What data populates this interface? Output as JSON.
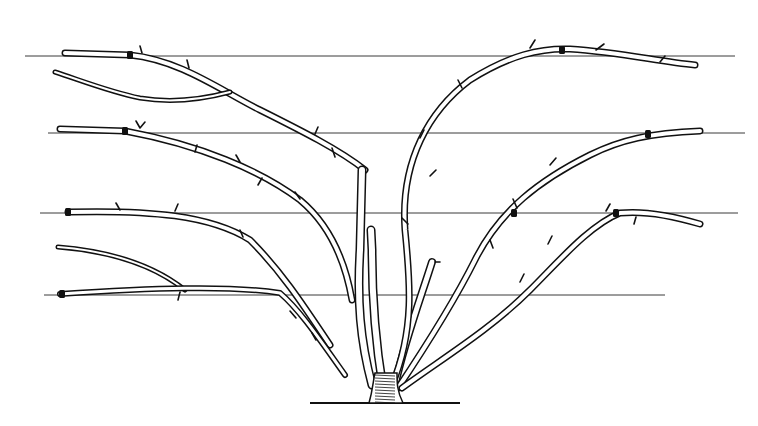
{
  "illustration": {
    "subject": "fan-trained shrub tied to horizontal support wires",
    "style": "black-and-white pen-and-ink line drawing",
    "colors": {
      "ink": "#111111",
      "background": "#ffffff",
      "wire": "#3a3a3a"
    },
    "wires": [
      {
        "y": 56,
        "x1": 25,
        "x2": 735
      },
      {
        "y": 133,
        "x1": 48,
        "x2": 745
      },
      {
        "y": 213,
        "x1": 40,
        "x2": 738
      },
      {
        "y": 295,
        "x1": 44,
        "x2": 665
      }
    ],
    "stems": [
      {
        "name": "left-top-cane",
        "w": 7,
        "d": "M365 170 C340 150 300 130 260 110 C220 90 180 60 130 55 L65 53"
      },
      {
        "name": "left-top-side",
        "w": 5,
        "d": "M230 92 C200 100 170 103 140 98 C110 92 80 80 55 72"
      },
      {
        "name": "left-center-cane",
        "w": 7,
        "d": "M352 300 C345 260 330 225 300 200 C260 170 200 145 125 131 L60 129"
      },
      {
        "name": "left-mid-cane",
        "w": 7,
        "d": "M330 345 C300 300 280 270 250 240 C210 215 150 210 68 212"
      },
      {
        "name": "left-low-side-a",
        "w": 5,
        "d": "M185 290 C160 270 120 252 58 247"
      },
      {
        "name": "left-low-cane",
        "w": 6,
        "d": "M345 375 C320 340 300 310 280 293 C230 285 150 288 60 294"
      },
      {
        "name": "center-left-trunk",
        "w": 9,
        "d": "M372 385 C360 340 357 300 360 250 L362 170"
      },
      {
        "name": "center-trunk",
        "w": 9,
        "d": "M383 388 C375 340 372 300 372 250 L371 230"
      },
      {
        "name": "center-right-trunk",
        "w": 8,
        "d": "M395 385 C405 340 420 300 432 262"
      },
      {
        "name": "right-tall-cane",
        "w": 7,
        "d": "M392 385 C415 330 410 280 405 230 C400 160 430 110 470 80 C510 55 540 48 570 49 C620 52 660 62 695 65"
      },
      {
        "name": "right-mid-cane",
        "w": 7,
        "d": "M398 388 C430 340 455 300 475 260 C500 210 540 180 590 155 C620 140 650 133 700 131"
      },
      {
        "name": "right-low-cane",
        "w": 7,
        "d": "M402 388 C440 360 490 330 530 290 C560 260 590 225 620 213 C650 210 680 218 700 224"
      }
    ],
    "spurs": [
      {
        "d": "M142 53 L140 46"
      },
      {
        "d": "M187 60 L189 68"
      },
      {
        "d": "M315 134 L318 127"
      },
      {
        "d": "M332 148 L335 157"
      },
      {
        "d": "M140 128 L136 121 M140 128 L145 122"
      },
      {
        "d": "M197 145 L195 152"
      },
      {
        "d": "M240 162 L236 155"
      },
      {
        "d": "M262 178 L258 185"
      },
      {
        "d": "M300 199 L295 192"
      },
      {
        "d": "M175 211 L178 204"
      },
      {
        "d": "M120 210 L116 203"
      },
      {
        "d": "M243 237 L240 230"
      },
      {
        "d": "M180 292 L178 300"
      },
      {
        "d": "M296 318 L290 311"
      },
      {
        "d": "M316 340 L312 333"
      },
      {
        "d": "M530 48 L535 40"
      },
      {
        "d": "M596 50 L604 44"
      },
      {
        "d": "M660 62 L665 56"
      },
      {
        "d": "M408 224 L402 218"
      },
      {
        "d": "M430 176 L436 170"
      },
      {
        "d": "M424 130 L420 138"
      },
      {
        "d": "M462 88 L458 80"
      },
      {
        "d": "M517 208 L513 199"
      },
      {
        "d": "M550 165 L556 158"
      },
      {
        "d": "M606 211 L610 204"
      },
      {
        "d": "M636 217 L634 224"
      },
      {
        "d": "M493 248 L490 240"
      },
      {
        "d": "M548 244 L552 236"
      },
      {
        "d": "M520 282 L524 274"
      },
      {
        "d": "M435 262 L440 262"
      }
    ],
    "ties": [
      {
        "x": 130,
        "y": 55
      },
      {
        "x": 125,
        "y": 131
      },
      {
        "x": 68,
        "y": 212
      },
      {
        "x": 62,
        "y": 294
      },
      {
        "x": 562,
        "y": 50
      },
      {
        "x": 648,
        "y": 134
      },
      {
        "x": 616,
        "y": 213
      },
      {
        "x": 514,
        "y": 213
      }
    ],
    "base": {
      "cx": 385,
      "cy": 403,
      "ground_x1": 310,
      "ground_x2": 460
    }
  }
}
